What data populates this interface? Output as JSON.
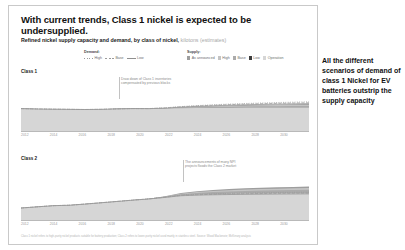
{
  "headline": "With current trends, Class 1 nickel is expected to be undersupplied.",
  "subtitle": {
    "main": "Refined nickel supply capacity and demand, by class of nickel,",
    "unit": "kilotons (estimates)"
  },
  "legends": {
    "demand": {
      "title": "Demand:",
      "items": [
        {
          "label": "High",
          "style": "dotted",
          "color": "#9a9a9a"
        },
        {
          "label": "Base",
          "style": "dashed",
          "color": "#9a9a9a"
        },
        {
          "label": "Low",
          "style": "solid",
          "color": "#8f8f8f"
        }
      ]
    },
    "supply": {
      "title": "Supply:",
      "items": [
        {
          "label": "As announced",
          "color": "#9e9e9e"
        },
        {
          "label": "High",
          "color": "#c4c4c4"
        },
        {
          "label": "Base",
          "color": "#ababab"
        },
        {
          "label": "Low",
          "color": "#3d3d3d"
        },
        {
          "label": "Operation",
          "color": "#d6d6d6"
        }
      ]
    }
  },
  "callout": "All the different scenarios of demand of class 1 Nickel for EV batteries outstrip the supply capacity",
  "footer": "Class 1 nickel refers to high-purity nickel products suitable for battery production; Class 2 refers to lower-purity nickel used mainly in stainless steel. Source: Wood Mackenzie; McKinsey analysis",
  "chart_data": [
    {
      "type": "area",
      "title": "Class 1",
      "xlabel": "",
      "ylabel": "kilotons",
      "x": [
        2012,
        2013,
        2014,
        2015,
        2016,
        2017,
        2018,
        2019,
        2020,
        2021,
        2022,
        2023,
        2024,
        2025,
        2026,
        2027,
        2028,
        2029,
        2030
      ],
      "xticks": [
        2012,
        2014,
        2016,
        2018,
        2020,
        2022,
        2024,
        2026,
        2028,
        2030
      ],
      "ylim": [
        0,
        1400
      ],
      "grid": false,
      "annotation": "Draw down of Class 1 inventories compensated by previous blocks",
      "series": [
        {
          "name": "Operation",
          "type": "area",
          "color": "#d6d6d6",
          "values": [
            980,
            965,
            955,
            948,
            940,
            948,
            968,
            980,
            975,
            985,
            1000,
            1005,
            1008,
            1010,
            1012,
            1014,
            1015,
            1016,
            1018
          ]
        },
        {
          "name": "Base",
          "type": "area",
          "color": "#ababab",
          "values": [
            980,
            965,
            955,
            948,
            940,
            948,
            968,
            980,
            975,
            990,
            1015,
            1035,
            1050,
            1062,
            1072,
            1080,
            1086,
            1092,
            1098
          ]
        },
        {
          "name": "High",
          "type": "area",
          "color": "#c4c4c4",
          "values": [
            980,
            965,
            955,
            948,
            940,
            948,
            968,
            980,
            975,
            995,
            1030,
            1055,
            1078,
            1096,
            1112,
            1124,
            1134,
            1142,
            1150
          ]
        },
        {
          "name": "As announced",
          "type": "area",
          "color": "#9e9e9e",
          "values": [
            980,
            965,
            955,
            948,
            940,
            948,
            968,
            980,
            975,
            998,
            1040,
            1070,
            1096,
            1118,
            1136,
            1150,
            1162,
            1172,
            1182
          ]
        },
        {
          "name": "Demand Low",
          "type": "line",
          "style": "solid",
          "color": "#8f8f8f",
          "values": [
            980,
            965,
            955,
            948,
            940,
            948,
            968,
            982,
            978,
            1000,
            1045,
            1078,
            1105,
            1128,
            1148,
            1164,
            1178,
            1190,
            1200
          ]
        },
        {
          "name": "Demand Base",
          "type": "line",
          "style": "dashed",
          "color": "#9a9a9a",
          "values": [
            980,
            965,
            955,
            948,
            940,
            948,
            968,
            982,
            980,
            1008,
            1058,
            1095,
            1126,
            1152,
            1175,
            1194,
            1210,
            1224,
            1236
          ]
        },
        {
          "name": "Demand High",
          "type": "line",
          "style": "dotted",
          "color": "#9a9a9a",
          "values": [
            980,
            965,
            955,
            948,
            940,
            948,
            968,
            982,
            982,
            1014,
            1070,
            1112,
            1148,
            1178,
            1204,
            1226,
            1246,
            1262,
            1278
          ]
        }
      ]
    },
    {
      "type": "area",
      "title": "Class 2",
      "xlabel": "",
      "ylabel": "kilotons",
      "x": [
        2012,
        2013,
        2014,
        2015,
        2016,
        2017,
        2018,
        2019,
        2020,
        2021,
        2022,
        2023,
        2024,
        2025,
        2026,
        2027,
        2028,
        2029,
        2030
      ],
      "xticks": [
        2012,
        2014,
        2016,
        2018,
        2020,
        2022,
        2024,
        2026,
        2028,
        2030
      ],
      "ylim": [
        0,
        2600
      ],
      "grid": false,
      "annotation": "The announcements of many NPI projects floods the Class 2 market",
      "series": [
        {
          "name": "Operation",
          "type": "area",
          "color": "#d6d6d6",
          "values": [
            820,
            900,
            980,
            1010,
            1090,
            1180,
            1270,
            1360,
            1440,
            1560,
            1690,
            1740,
            1770,
            1790,
            1805,
            1815,
            1822,
            1828,
            1834
          ]
        },
        {
          "name": "Base",
          "type": "area",
          "color": "#ababab",
          "values": [
            820,
            900,
            980,
            1010,
            1090,
            1180,
            1270,
            1360,
            1450,
            1590,
            1760,
            1850,
            1910,
            1955,
            1990,
            2015,
            2035,
            2050,
            2065
          ]
        },
        {
          "name": "High",
          "type": "area",
          "color": "#c4c4c4",
          "values": [
            820,
            900,
            980,
            1010,
            1090,
            1180,
            1270,
            1360,
            1455,
            1610,
            1800,
            1910,
            1985,
            2040,
            2085,
            2118,
            2145,
            2166,
            2185
          ]
        },
        {
          "name": "As announced",
          "type": "area",
          "color": "#9e9e9e",
          "values": [
            820,
            900,
            980,
            1010,
            1090,
            1180,
            1270,
            1365,
            1462,
            1630,
            1840,
            1965,
            2050,
            2115,
            2168,
            2208,
            2240,
            2266,
            2290
          ]
        },
        {
          "name": "Demand Low",
          "type": "line",
          "style": "solid",
          "color": "#8f8f8f",
          "values": [
            820,
            900,
            980,
            1010,
            1090,
            1180,
            1270,
            1360,
            1440,
            1545,
            1660,
            1700,
            1725,
            1742,
            1756,
            1766,
            1774,
            1780,
            1786
          ]
        },
        {
          "name": "Demand Base",
          "type": "line",
          "style": "dashed",
          "color": "#9a9a9a",
          "values": [
            820,
            900,
            980,
            1010,
            1090,
            1180,
            1270,
            1360,
            1445,
            1558,
            1682,
            1728,
            1758,
            1780,
            1798,
            1812,
            1824,
            1834,
            1842
          ]
        },
        {
          "name": "Demand High",
          "type": "line",
          "style": "dotted",
          "color": "#9a9a9a",
          "values": [
            820,
            900,
            980,
            1010,
            1090,
            1180,
            1270,
            1360,
            1448,
            1570,
            1705,
            1758,
            1794,
            1822,
            1845,
            1864,
            1880,
            1894,
            1906
          ]
        }
      ]
    }
  ]
}
